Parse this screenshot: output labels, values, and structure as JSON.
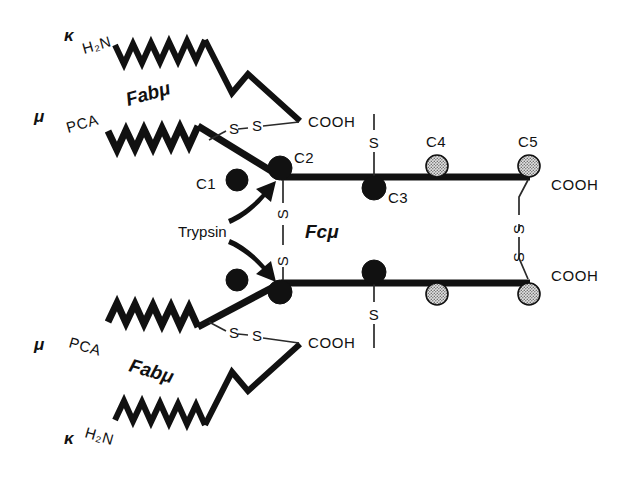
{
  "figure": {
    "background_color": "#ffffff",
    "ink_color": "#111111",
    "gray_circle_color": "#c9c9c9"
  },
  "labels": {
    "kappa_symbol": "κ",
    "mu_symbol": "μ",
    "h2n": "H₂N",
    "pca": "PCA",
    "cooh": "COOH",
    "fab_mu": "Fabμ",
    "fc_mu": "Fcμ",
    "trypsin": "Trypsin",
    "sulfur": "S",
    "disulfide": "S—S"
  },
  "domains": {
    "c1": "C1",
    "c2": "C2",
    "c3": "C3",
    "c4": "C4",
    "c5": "C5"
  },
  "annotations": {
    "top_arm": {
      "light_chain_type": "κ",
      "light_chain_nterm": "H₂N",
      "heavy_chain_type": "μ",
      "heavy_chain_nterm": "PCA",
      "light_chain_cterm": "COOH",
      "region": "Fabμ"
    },
    "bottom_arm": {
      "light_chain_type": "κ",
      "light_chain_nterm": "H₂N",
      "heavy_chain_type": "μ",
      "heavy_chain_nterm": "PCA",
      "light_chain_cterm": "COOH",
      "region": "Fabμ"
    },
    "fc_region": {
      "region": "Fcμ",
      "heavy_chain_cterm_top": "COOH",
      "heavy_chain_cterm_bottom": "COOH",
      "inter_chain_disulfide": "S—S",
      "cleavage_enzyme": "Trypsin"
    },
    "carbohydrate_filled": [
      "C1",
      "C2",
      "C3"
    ],
    "carbohydrate_stippled": [
      "C4",
      "C5"
    ]
  },
  "legend_notes": {
    "filled_circle_meaning": "C1 C2 C3",
    "stippled_circle_meaning": "C4 C5"
  }
}
